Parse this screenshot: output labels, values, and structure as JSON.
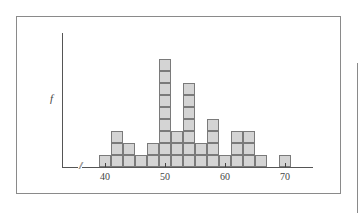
{
  "chart_data": {
    "type": "bar",
    "subtype": "stacked-box histogram",
    "title": "",
    "xlabel": "",
    "ylabel": "f",
    "bin_width": 2,
    "categories": [
      "39-41",
      "41-43",
      "43-45",
      "45-47",
      "47-49",
      "49-51",
      "51-53",
      "53-55",
      "55-57",
      "57-59",
      "59-61",
      "61-63",
      "63-65",
      "65-67",
      "67-69",
      "69-71"
    ],
    "bin_centers": [
      40,
      42,
      44,
      46,
      48,
      50,
      52,
      54,
      56,
      58,
      60,
      62,
      64,
      66,
      68,
      70
    ],
    "values": [
      1,
      3,
      2,
      1,
      2,
      9,
      3,
      7,
      2,
      4,
      1,
      3,
      3,
      1,
      0,
      1
    ],
    "xticks": [
      40,
      50,
      60,
      70
    ],
    "xtick_labels": [
      "40",
      "50",
      "60",
      "70"
    ],
    "xlim": [
      36,
      75
    ],
    "axis_break": true,
    "grid": false,
    "legend": null
  },
  "axis": {
    "ylabel": "f",
    "break_symbol": "//"
  }
}
